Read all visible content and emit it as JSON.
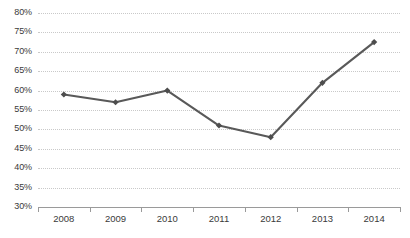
{
  "chart_data": {
    "type": "line",
    "title": "",
    "subtitle": "",
    "xlabel": "",
    "ylabel": "",
    "categories": [
      "2008",
      "2009",
      "2010",
      "2011",
      "2012",
      "2013",
      "2014"
    ],
    "values": [
      59,
      57,
      60,
      51,
      48,
      62,
      72.5
    ],
    "series": [
      {
        "name": "",
        "values": [
          59,
          57,
          60,
          51,
          48,
          62,
          72.5
        ]
      }
    ],
    "ylim": [
      30,
      80
    ],
    "ytick_step": 5,
    "ytick_labels": [
      "80%",
      "75%",
      "70%",
      "65%",
      "60%",
      "55%",
      "50%",
      "45%",
      "40%",
      "35%",
      "30%"
    ],
    "ytick_values": [
      80,
      75,
      70,
      65,
      60,
      55,
      50,
      45,
      40,
      35,
      30
    ],
    "value_suffix": "%",
    "grid": true,
    "grid_axis": "y",
    "grid_style": "dotted",
    "legend": false,
    "legend_position": "none",
    "markers": "diamond",
    "colors": {
      "series_line": "#595959",
      "marker": "#4d4d4d",
      "gridline": "#c9c9c9",
      "axis_line": "#9a9a9a",
      "tick_label": "#3a3a3a",
      "background": "#ffffff"
    }
  }
}
